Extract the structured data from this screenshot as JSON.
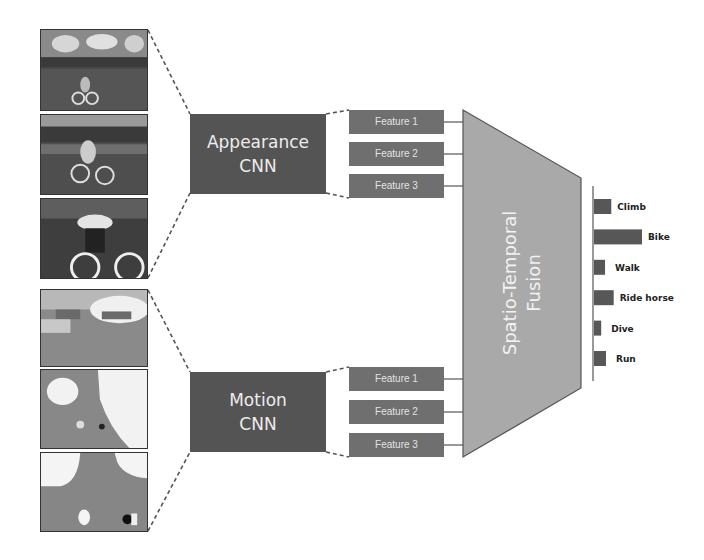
{
  "figure": {
    "appearance_stream": {
      "label_line1": "Appearance",
      "label_line2": "CNN",
      "frames": [
        "rgb-frame-1",
        "rgb-frame-2",
        "rgb-frame-3"
      ],
      "features": [
        "Feature 1",
        "Feature 2",
        "Feature 3"
      ]
    },
    "motion_stream": {
      "label_line1": "Motion",
      "label_line2": "CNN",
      "frames": [
        "flow-frame-1",
        "flow-frame-2",
        "flow-frame-3"
      ],
      "features": [
        "Feature 1",
        "Feature 2",
        "Feature 3"
      ]
    },
    "fusion": {
      "label_line1": "Spatio-Temporal",
      "label_line2": "Fusion"
    },
    "colors": {
      "cnn_box": "#545454",
      "feature_box": "#6f6f6f",
      "fusion": "#a9a9a9",
      "output_bar": "#575757"
    }
  },
  "chart_data": {
    "type": "bar",
    "orientation": "horizontal",
    "title": "",
    "xlabel": "",
    "ylabel": "",
    "categories": [
      "Climb",
      "Bike",
      "Walk",
      "Ride horse",
      "Dive",
      "Run"
    ],
    "values": [
      0.36,
      1.0,
      0.23,
      0.41,
      0.15,
      0.25
    ],
    "xlim": [
      0,
      1
    ],
    "grid": false,
    "legend": "none"
  }
}
